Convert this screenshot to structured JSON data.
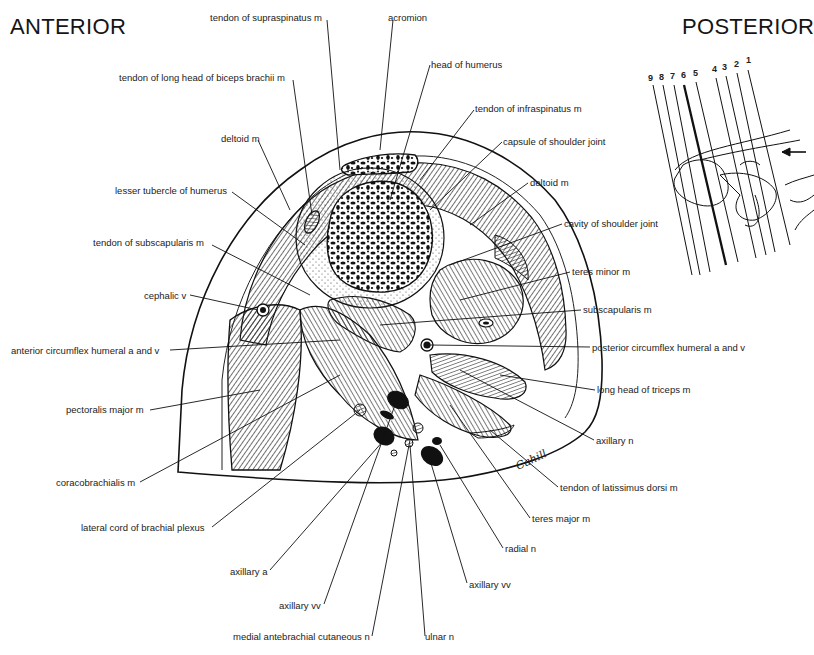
{
  "orientation": {
    "left": "ANTERIOR",
    "right": "POSTERIOR"
  },
  "labels": [
    {
      "id": "tendon-supraspinatus",
      "text": "tendon of supraspinatus m",
      "x": 210,
      "y": 12
    },
    {
      "id": "acromion",
      "text": "acromion",
      "x": 388,
      "y": 12
    },
    {
      "id": "tendon-long-head-biceps",
      "text": "tendon of long head of biceps brachii m",
      "x": 119,
      "y": 72
    },
    {
      "id": "head-of-humerus",
      "text": "head of humerus",
      "x": 431,
      "y": 59
    },
    {
      "id": "tendon-infraspinatus",
      "text": "tendon of infraspinatus m",
      "x": 475,
      "y": 103
    },
    {
      "id": "deltoid-left",
      "text": "deltoid m",
      "x": 221,
      "y": 133
    },
    {
      "id": "capsule-shoulder-joint",
      "text": "capsule of shoulder joint",
      "x": 503,
      "y": 136
    },
    {
      "id": "deltoid-right",
      "text": "deltoid m",
      "x": 530,
      "y": 177
    },
    {
      "id": "lesser-tubercle",
      "text": "lesser tubercle of humerus",
      "x": 115,
      "y": 185
    },
    {
      "id": "cavity-shoulder-joint",
      "text": "cavity of shoulder joint",
      "x": 564,
      "y": 218
    },
    {
      "id": "tendon-subscapularis",
      "text": "tendon of subscapularis m",
      "x": 93,
      "y": 237
    },
    {
      "id": "teres-minor",
      "text": "teres minor m",
      "x": 572,
      "y": 266
    },
    {
      "id": "cephalic-v",
      "text": "cephalic v",
      "x": 144,
      "y": 290
    },
    {
      "id": "subscapularis",
      "text": "subscapularis m",
      "x": 583,
      "y": 304
    },
    {
      "id": "anterior-circumflex",
      "text": "anterior circumflex humeral a and v",
      "x": 11,
      "y": 345
    },
    {
      "id": "posterior-circumflex",
      "text": "posterior circumflex humeral a and v",
      "x": 592,
      "y": 342
    },
    {
      "id": "long-head-triceps",
      "text": "long head of triceps m",
      "x": 597,
      "y": 384
    },
    {
      "id": "pectoralis-major",
      "text": "pectoralis major m",
      "x": 66,
      "y": 404
    },
    {
      "id": "axillary-n",
      "text": "axillary n",
      "x": 596,
      "y": 435
    },
    {
      "id": "coracobrachialis",
      "text": "coracobrachialis m",
      "x": 56,
      "y": 477
    },
    {
      "id": "tendon-latissimus-dorsi",
      "text": "tendon of latissimus dorsi m",
      "x": 560,
      "y": 482
    },
    {
      "id": "lateral-cord",
      "text": "lateral cord of brachial plexus",
      "x": 81,
      "y": 522
    },
    {
      "id": "teres-major",
      "text": "teres major m",
      "x": 532,
      "y": 513
    },
    {
      "id": "radial-n",
      "text": "radial n",
      "x": 505,
      "y": 543
    },
    {
      "id": "axillary-a",
      "text": "axillary a",
      "x": 230,
      "y": 566
    },
    {
      "id": "axillary-vv-right",
      "text": "axillary vv",
      "x": 469,
      "y": 579
    },
    {
      "id": "axillary-vv-left",
      "text": "axillary vv",
      "x": 279,
      "y": 600
    },
    {
      "id": "medial-antebrachial-cutaneous",
      "text": "medial antebrachial cutaneous n",
      "x": 233,
      "y": 631
    },
    {
      "id": "ulnar-n",
      "text": "ulnar n",
      "x": 425,
      "y": 631
    }
  ],
  "inset": {
    "section_numbers": [
      "9",
      "8",
      "7",
      "6",
      "5",
      "4",
      "3",
      "2",
      "1"
    ],
    "highlighted_section": "6",
    "arrow": "left-arrow"
  },
  "signature": "Cahill"
}
